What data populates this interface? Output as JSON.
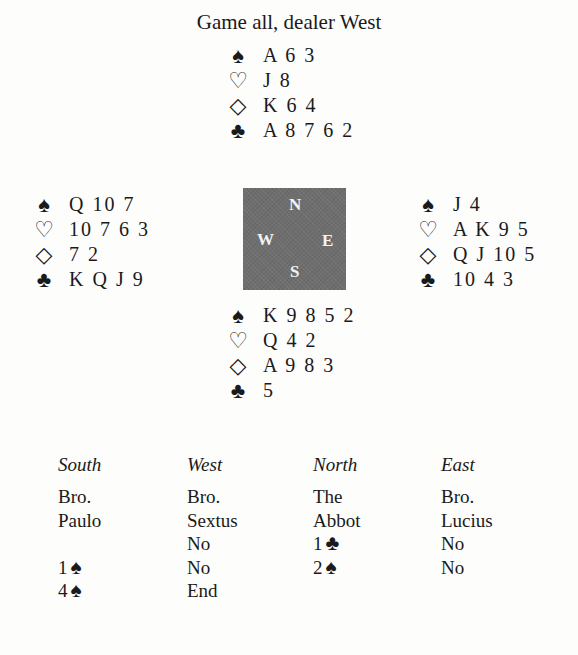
{
  "title": "Game all, dealer West",
  "suit_icons": {
    "spades": "♠",
    "hearts": "♡",
    "diamonds": "◇",
    "clubs": "♣"
  },
  "hands": {
    "north": {
      "spades": "A 6 3",
      "hearts": "J 8",
      "diamonds": "K 6 4",
      "clubs": "A 8 7 6 2"
    },
    "west": {
      "spades": "Q 10 7",
      "hearts": "10 7 6 3",
      "diamonds": "7 2",
      "clubs": "K Q J 9"
    },
    "east": {
      "spades": "J 4",
      "hearts": "A K 9 5",
      "diamonds": "Q J 10 5",
      "clubs": "10 4 3"
    },
    "south": {
      "spades": "K 9 8 5 2",
      "hearts": "Q 4 2",
      "diamonds": "A 9 8 3",
      "clubs": "5"
    }
  },
  "compass": {
    "n": "N",
    "w": "W",
    "e": "E",
    "s": "S",
    "color": "#6e6e6e"
  },
  "bidding": {
    "headers": [
      "South",
      "West",
      "North",
      "East"
    ],
    "players": {
      "south": [
        "Bro.",
        "Paulo"
      ],
      "west": [
        "Bro.",
        "Sextus"
      ],
      "north": [
        "The",
        "Abbot"
      ],
      "east": [
        "Bro.",
        "Lucius"
      ]
    },
    "rounds": [
      {
        "south": "",
        "west": "No",
        "north": "1",
        "north_suit": "♣",
        "east": "No"
      },
      {
        "south": "1",
        "south_suit": "♠",
        "west": "No",
        "north": "2",
        "north_suit": "♠",
        "east": "No"
      },
      {
        "south": "4",
        "south_suit": "♠",
        "west": "End"
      }
    ]
  }
}
